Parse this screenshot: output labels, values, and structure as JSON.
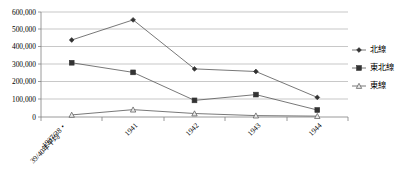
{
  "chart_data": {
    "type": "line",
    "title": "",
    "xlabel": "",
    "ylabel": "",
    "ylim": [
      0,
      600000
    ],
    "yticks": [
      "0",
      "100,000",
      "200,000",
      "300,000",
      "400,000",
      "500,000",
      "600,000"
    ],
    "ytick_values": [
      0,
      100000,
      200000,
      300000,
      400000,
      500000,
      600000
    ],
    "grid": true,
    "legend_position": "right",
    "categories": [
      "1937/38・\n39/40年平均",
      "1941",
      "1942",
      "1943",
      "1944"
    ],
    "category_lines": [
      [
        "1937/38・",
        "39/40年平均"
      ],
      [
        "1941"
      ],
      [
        "1942"
      ],
      [
        "1943"
      ],
      [
        "1944"
      ]
    ],
    "series": [
      {
        "name": "北線",
        "marker": "diamond",
        "values": [
          440000,
          555000,
          275000,
          260000,
          112000
        ]
      },
      {
        "name": "東北線",
        "marker": "square",
        "values": [
          310000,
          255000,
          95000,
          128000,
          40000
        ]
      },
      {
        "name": "東線",
        "marker": "triangle",
        "values": [
          12000,
          42000,
          20000,
          8000,
          5000
        ]
      }
    ],
    "colors": {
      "line": "#555555",
      "marker": "#333333",
      "grid": "#b0b0b0",
      "axis": "#808080",
      "text": "#000000"
    }
  },
  "legend": {
    "items": [
      {
        "label": "北線",
        "marker": "diamond"
      },
      {
        "label": "東北線",
        "marker": "square"
      },
      {
        "label": "東線",
        "marker": "triangle"
      }
    ]
  },
  "axes": {
    "y_tick_labels": [
      "600,000",
      "500,000",
      "400,000",
      "300,000",
      "200,000",
      "100,000",
      "0"
    ],
    "x_tick_labels": [
      "1937/38・",
      "39/40年平均",
      "1941",
      "1942",
      "1943",
      "1944"
    ]
  }
}
